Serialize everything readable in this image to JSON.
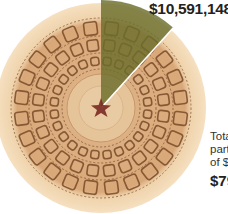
{
  "chart_data": {
    "type": "pie",
    "title": "",
    "background_image": "capitol-dome-interior",
    "slices": [
      {
        "name": "Highlighted amount",
        "value": 10591148,
        "label": "$10,591,148",
        "color": "#6b6e2c"
      },
      {
        "name": "Remainder of total",
        "value": 69000000,
        "label": "",
        "color": "#e9c9a0"
      }
    ],
    "highlight_start_deg": 0,
    "highlight_end_deg": 42,
    "annotation": {
      "lines": [
        "Tota",
        "part",
        "of $"
      ],
      "value": "$79"
    }
  },
  "labels": {
    "highlight_value": "$10,591,148",
    "note_line1": "Tota",
    "note_line2": "part",
    "note_line3": "of $",
    "total_value": "$79"
  },
  "colors": {
    "highlight": "#6b6e2c",
    "dome_outer": "#f2d9b5",
    "dome_inner": "#d9a878",
    "coffer_line": "#7a4a28",
    "star": "#7a2a24"
  }
}
